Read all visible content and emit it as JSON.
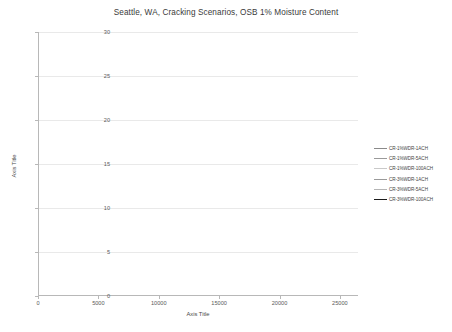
{
  "chart_data": {
    "type": "line",
    "title": "Seattle, WA, Cracking Scenarios, OSB 1% Moisture Content",
    "xlabel": "Axis Title",
    "ylabel": "Axis Title",
    "xlim": [
      0,
      26500
    ],
    "ylim": [
      0,
      30
    ],
    "xticks": [
      "0",
      "5000",
      "10000",
      "15000",
      "20000",
      "25000"
    ],
    "xtick_values": [
      0,
      5000,
      10000,
      15000,
      20000,
      25000
    ],
    "yticks": [
      "0",
      "5",
      "10",
      "15",
      "20",
      "25",
      "30"
    ],
    "ytick_values": [
      0,
      5,
      10,
      15,
      20,
      25,
      30
    ],
    "grid": "horizontal",
    "legend_position": "right",
    "x": [
      0,
      250,
      500,
      750,
      1000,
      1250,
      1500,
      1750,
      2000,
      2250,
      2500,
      2750,
      3000,
      3250,
      3500,
      3750,
      4000,
      4250,
      4500,
      4750,
      5000,
      5250,
      5500,
      5750,
      6000,
      6250,
      6500,
      6750,
      7000,
      7250,
      7500,
      7750,
      8000,
      8250,
      8500,
      8750,
      9000,
      9250,
      9500,
      9750,
      10000,
      10250,
      10500,
      10750,
      11000,
      11250,
      11500,
      11750,
      12000,
      12250,
      12500,
      12750,
      13000,
      13250,
      13500,
      13750,
      14000,
      14250,
      14500,
      14750,
      15000,
      15250,
      15500,
      15750,
      16000,
      16250,
      16500,
      16750,
      17000,
      17250,
      17500,
      17750,
      18000,
      18250,
      18500,
      18750,
      19000,
      19250,
      19500,
      19750,
      20000,
      20250,
      20500,
      20750,
      21000,
      21250,
      21500,
      21750,
      22000,
      22250,
      22500,
      22750,
      23000,
      23250,
      23500,
      23750,
      24000,
      24250,
      24500,
      24750,
      25000,
      25250,
      25500,
      25750,
      26000
    ],
    "series": [
      {
        "name": "CR-1%WDR-1ACH",
        "color": "#8a8a8a",
        "width": 0.8,
        "values": [
          11.0,
          12.6,
          14.2,
          15.5,
          16.8,
          17.8,
          18.6,
          19.3,
          19.8,
          20.2,
          20.5,
          20.7,
          20.6,
          20.8,
          21.0,
          20.8,
          20.6,
          20.9,
          20.6,
          20.3,
          20.5,
          20.1,
          19.7,
          19.9,
          19.4,
          19.0,
          18.6,
          18.9,
          18.3,
          17.6,
          16.6,
          16.3,
          17.0,
          16.5,
          17.2,
          17.6,
          18.5,
          19.4,
          20.3,
          21.1,
          21.8,
          22.4,
          22.9,
          23.3,
          23.7,
          24.0,
          24.3,
          24.5,
          24.8,
          25.0,
          25.2,
          25.3,
          25.5,
          25.6,
          25.4,
          25.6,
          25.4,
          25.2,
          25.4,
          25.0,
          24.7,
          24.9,
          24.4,
          24.0,
          23.5,
          23.8,
          23.2,
          22.6,
          21.8,
          21.4,
          22.0,
          21.5,
          22.2,
          22.8,
          23.4,
          23.9,
          24.3,
          24.6,
          24.9,
          25.1,
          25.3,
          25.4,
          25.6,
          25.5,
          25.7,
          25.5,
          25.3,
          25.4,
          25.1,
          24.8,
          24.4,
          24.0,
          23.5,
          23.0,
          22.6,
          22.1,
          21.6,
          21.2,
          20.8,
          21.4,
          22.0,
          22.6,
          23.0,
          22.6,
          23.2
        ]
      },
      {
        "name": "CR-1%WDR-5ACH",
        "color": "#9a9a9a",
        "width": 0.8,
        "values": [
          11.0,
          12.2,
          13.4,
          14.5,
          15.5,
          16.3,
          17.0,
          17.5,
          17.9,
          18.2,
          18.4,
          18.6,
          18.5,
          18.7,
          18.8,
          18.6,
          18.4,
          18.6,
          18.3,
          18.0,
          18.2,
          17.8,
          17.4,
          17.6,
          17.1,
          16.7,
          16.3,
          16.5,
          16.0,
          15.3,
          14.4,
          14.1,
          14.7,
          14.3,
          14.9,
          15.3,
          16.0,
          16.7,
          17.4,
          18.0,
          18.6,
          19.0,
          19.4,
          19.7,
          20.0,
          20.3,
          20.5,
          20.7,
          20.9,
          21.0,
          21.2,
          21.3,
          21.4,
          21.5,
          21.3,
          21.5,
          21.3,
          21.1,
          21.3,
          21.0,
          20.7,
          20.9,
          20.5,
          20.1,
          19.7,
          19.9,
          19.4,
          18.8,
          18.1,
          17.7,
          18.2,
          17.8,
          18.4,
          18.9,
          19.4,
          19.8,
          20.2,
          20.4,
          20.7,
          20.9,
          21.0,
          21.2,
          21.3,
          21.2,
          21.4,
          21.2,
          21.0,
          21.1,
          20.8,
          20.5,
          20.1,
          19.7,
          19.3,
          18.8,
          18.4,
          18.0,
          17.6,
          17.2,
          16.8,
          17.3,
          17.9,
          18.4,
          18.8,
          18.4,
          19.0
        ]
      },
      {
        "name": "CR-1%WDR-100ACH",
        "color": "#c9c9c9",
        "width": 0.8,
        "values": [
          11.0,
          11.9,
          12.9,
          13.7,
          14.5,
          15.1,
          15.6,
          16.0,
          16.3,
          16.5,
          16.7,
          16.8,
          16.7,
          16.9,
          17.0,
          16.8,
          16.6,
          16.8,
          16.5,
          16.2,
          16.4,
          16.0,
          15.6,
          15.8,
          15.3,
          14.9,
          14.5,
          14.7,
          14.2,
          13.5,
          12.7,
          12.4,
          13.0,
          12.6,
          13.1,
          13.5,
          14.1,
          14.7,
          15.3,
          15.8,
          16.3,
          16.7,
          17.0,
          17.3,
          17.6,
          17.8,
          18.0,
          18.2,
          18.4,
          18.5,
          18.6,
          18.7,
          18.8,
          18.9,
          18.7,
          18.9,
          18.7,
          18.5,
          18.7,
          18.4,
          18.1,
          18.3,
          17.9,
          17.5,
          17.1,
          17.3,
          16.8,
          16.3,
          15.7,
          15.3,
          15.8,
          15.4,
          15.9,
          16.4,
          16.8,
          17.2,
          17.5,
          17.8,
          18.0,
          18.2,
          18.3,
          18.4,
          18.5,
          18.4,
          18.6,
          18.4,
          18.2,
          18.3,
          18.0,
          17.7,
          17.4,
          17.0,
          16.6,
          16.2,
          15.8,
          15.4,
          15.0,
          14.6,
          14.3,
          14.8,
          15.3,
          15.8,
          16.2,
          15.8,
          16.3
        ]
      },
      {
        "name": "CR-3%WDR-1ACH",
        "color": "#9a9a9a",
        "width": 0.8,
        "values": [
          11.0,
          11.7,
          12.4,
          13.0,
          13.6,
          14.0,
          14.4,
          14.7,
          14.9,
          15.1,
          15.2,
          15.3,
          15.2,
          15.4,
          15.5,
          15.3,
          15.1,
          15.3,
          15.0,
          14.7,
          14.9,
          14.5,
          14.1,
          14.3,
          13.8,
          13.4,
          13.0,
          13.2,
          12.7,
          12.1,
          11.4,
          11.1,
          11.6,
          11.3,
          11.8,
          12.1,
          12.7,
          13.2,
          13.8,
          14.3,
          14.7,
          15.1,
          15.4,
          15.7,
          15.9,
          16.1,
          16.3,
          16.5,
          16.6,
          16.7,
          16.9,
          17.0,
          17.1,
          17.2,
          17.0,
          17.2,
          17.0,
          16.8,
          17.0,
          16.7,
          16.4,
          16.6,
          16.2,
          15.8,
          15.4,
          15.6,
          15.1,
          14.6,
          14.1,
          13.7,
          14.2,
          13.8,
          14.3,
          14.8,
          15.2,
          15.6,
          15.9,
          16.2,
          16.4,
          16.6,
          16.7,
          16.8,
          16.9,
          16.8,
          17.0,
          16.8,
          16.6,
          16.7,
          16.4,
          16.1,
          15.8,
          15.4,
          15.0,
          14.6,
          14.2,
          13.8,
          13.4,
          13.0,
          12.7,
          13.2,
          13.7,
          14.2,
          14.6,
          14.2,
          14.7
        ]
      },
      {
        "name": "CR-3%WDR-5ACH",
        "color": "#b5b5b5",
        "width": 0.8,
        "values": [
          11.0,
          11.5,
          12.0,
          12.4,
          12.7,
          12.9,
          13.0,
          13.1,
          13.1,
          13.0,
          12.9,
          12.8,
          12.6,
          12.7,
          12.6,
          12.4,
          12.2,
          12.3,
          12.0,
          11.7,
          11.8,
          11.5,
          11.2,
          11.3,
          10.9,
          10.5,
          10.1,
          10.2,
          9.8,
          9.2,
          8.6,
          8.3,
          8.7,
          8.4,
          8.8,
          9.1,
          9.6,
          10.1,
          10.6,
          11.0,
          11.4,
          11.7,
          12.0,
          12.2,
          12.4,
          12.6,
          12.7,
          12.8,
          12.9,
          12.9,
          13.0,
          13.0,
          13.0,
          13.0,
          12.8,
          12.9,
          12.7,
          12.5,
          12.6,
          12.3,
          12.0,
          12.1,
          11.8,
          11.4,
          11.0,
          11.1,
          10.7,
          10.3,
          9.9,
          9.6,
          9.9,
          9.6,
          10.0,
          10.4,
          10.8,
          11.1,
          11.4,
          11.6,
          11.8,
          11.9,
          12.0,
          12.1,
          12.2,
          12.1,
          12.3,
          12.1,
          11.9,
          12.0,
          11.7,
          11.4,
          11.1,
          10.8,
          10.4,
          10.1,
          9.7,
          9.4,
          9.0,
          8.7,
          8.4,
          8.8,
          9.2,
          9.6,
          9.9,
          9.6,
          10.0
        ]
      },
      {
        "name": "CR-3%WDR-100ACH",
        "color": "#1a1a1a",
        "width": 1.5,
        "values": [
          11.0,
          11.7,
          12.2,
          12.6,
          12.9,
          13.1,
          13.2,
          13.3,
          13.3,
          13.2,
          13.1,
          13.0,
          12.8,
          12.9,
          12.8,
          12.6,
          12.4,
          12.5,
          12.2,
          11.9,
          12.0,
          11.7,
          11.4,
          11.5,
          11.1,
          10.7,
          10.3,
          10.4,
          10.0,
          9.4,
          8.8,
          8.5,
          8.9,
          8.6,
          9.0,
          9.3,
          9.8,
          10.3,
          10.8,
          11.2,
          11.6,
          11.9,
          12.2,
          12.4,
          12.6,
          12.8,
          12.9,
          13.0,
          13.1,
          13.1,
          13.2,
          13.2,
          13.2,
          13.2,
          13.0,
          13.1,
          12.9,
          12.7,
          12.8,
          12.5,
          12.2,
          12.3,
          12.0,
          11.6,
          11.2,
          11.3,
          10.9,
          10.5,
          10.1,
          9.8,
          10.1,
          9.8,
          10.2,
          10.6,
          11.0,
          11.3,
          11.6,
          11.8,
          12.0,
          12.1,
          12.2,
          12.3,
          12.4,
          12.3,
          12.5,
          12.3,
          12.1,
          12.2,
          11.9,
          11.6,
          11.3,
          11.0,
          10.6,
          10.3,
          9.9,
          9.6,
          9.2,
          8.9,
          8.6,
          9.0,
          9.4,
          9.8,
          10.1,
          9.8,
          10.2
        ]
      }
    ]
  }
}
